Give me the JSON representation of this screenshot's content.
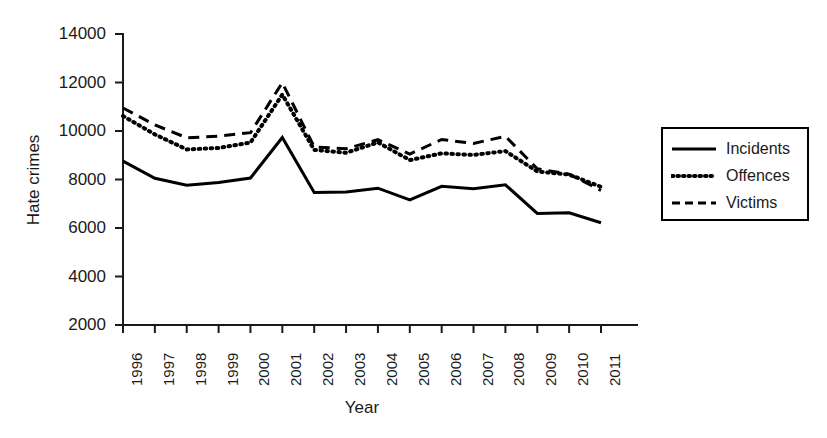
{
  "chart_data": {
    "type": "line",
    "title": "",
    "xlabel": "Year",
    "ylabel": "Hate crimes",
    "categories": [
      "1996",
      "1997",
      "1998",
      "1999",
      "2000",
      "2001",
      "2002",
      "2003",
      "2004",
      "2005",
      "2006",
      "2007",
      "2008",
      "2009",
      "2010",
      "2011"
    ],
    "xlim": [
      1996,
      2011
    ],
    "ylim": [
      2000,
      14000
    ],
    "yticks": [
      2000,
      4000,
      6000,
      8000,
      10000,
      12000,
      14000
    ],
    "grid": false,
    "legend_position": "right",
    "series": [
      {
        "name": "Incidents",
        "style": "solid",
        "color": "#000000",
        "values": [
          8760,
          8050,
          7760,
          7880,
          8060,
          9730,
          7460,
          7490,
          7640,
          7160,
          7720,
          7620,
          7780,
          6600,
          6630,
          6220
        ]
      },
      {
        "name": "Offences",
        "style": "dotted",
        "color": "#000000",
        "values": [
          10620,
          9860,
          9240,
          9300,
          9520,
          11500,
          9220,
          9100,
          9530,
          8800,
          9080,
          9010,
          9170,
          8330,
          8200,
          7700
        ]
      },
      {
        "name": "Victims",
        "style": "dashed",
        "color": "#000000",
        "values": [
          10950,
          10250,
          9720,
          9790,
          9930,
          11990,
          9340,
          9270,
          9640,
          9050,
          9650,
          9490,
          9780,
          8440,
          8220,
          7550
        ]
      }
    ]
  },
  "legend": {
    "items": [
      {
        "label": "Incidents",
        "style": "solid"
      },
      {
        "label": "Offences",
        "style": "dotted"
      },
      {
        "label": "Victims",
        "style": "dashed"
      }
    ]
  }
}
